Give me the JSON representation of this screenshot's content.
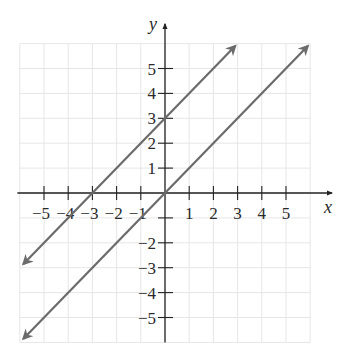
{
  "chart_data": {
    "type": "line",
    "title": "",
    "xlabel": "x",
    "ylabel": "y",
    "xlim": [
      -6,
      6
    ],
    "ylim": [
      -6,
      6
    ],
    "grid": true,
    "x_ticks": [
      -5,
      -4,
      -3,
      -2,
      -1,
      1,
      2,
      3,
      4,
      5
    ],
    "y_ticks": [
      -5,
      -4,
      -3,
      -2,
      1,
      2,
      3,
      4,
      5
    ],
    "x_tick_labels": [
      "−5",
      "−4",
      "−3",
      "−2",
      "−1",
      "1",
      "2",
      "3",
      "4",
      "5"
    ],
    "y_tick_labels": [
      "−5",
      "−4",
      "−3",
      "−2",
      "1",
      "2",
      "3",
      "4",
      "5"
    ],
    "series": [
      {
        "name": "y = x + 3",
        "slope": 1,
        "intercept": 3,
        "x": [
          -5.85,
          2.9
        ],
        "y": [
          -2.85,
          5.9
        ],
        "arrows": "both"
      },
      {
        "name": "y = x",
        "slope": 1,
        "intercept": 0,
        "x": [
          -5.85,
          5.9
        ],
        "y": [
          -5.85,
          5.9
        ],
        "arrows": "both"
      }
    ],
    "legend": null
  },
  "colors": {
    "line": "#6b6b6b",
    "axis": "#222222",
    "grid": "#e6e6e6"
  },
  "layout": {
    "origin_px": [
      165,
      193
    ],
    "unit_x_px": 24.2,
    "unit_y_px": 24.9,
    "grid_bounds": [
      -6,
      6,
      -6,
      6
    ]
  }
}
